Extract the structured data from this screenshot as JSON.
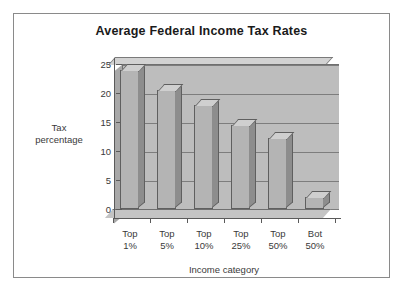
{
  "chart_data": {
    "type": "bar",
    "title": "Average Federal Income Tax Rates",
    "xlabel": "Income category",
    "ylabel": "Tax percentage",
    "ylabel_lines": [
      "Tax",
      "percentage"
    ],
    "categories": [
      "Top 1%",
      "Top 5%",
      "Top 10%",
      "Top 25%",
      "Top 50%",
      "Bot 50%"
    ],
    "category_lines": [
      [
        "Top",
        "1%"
      ],
      [
        "Top",
        "5%"
      ],
      [
        "Top",
        "10%"
      ],
      [
        "Top",
        "25%"
      ],
      [
        "Top",
        "50%"
      ],
      [
        "Bot",
        "50%"
      ]
    ],
    "values": [
      24,
      20.5,
      18,
      14.5,
      12.3,
      2
    ],
    "ylim": [
      0,
      25
    ],
    "yticks": [
      0,
      5,
      10,
      15,
      20,
      25
    ],
    "ytick_labels": [
      "0",
      "5",
      "10",
      "15",
      "20",
      "25"
    ],
    "grid": true,
    "legend": false,
    "style": "3d-bar",
    "colors": {
      "bar_front": "#b4b4b4",
      "bar_side": "#8d8d8d",
      "bar_top": "#cfcfcf",
      "plot_background": "#bdbdbd",
      "floor": "#c4c4c4",
      "axis": "#5a5a5a",
      "gridline": "#7d7d7d",
      "frame_border": "#8a8a8a",
      "page_background": "#ffffff",
      "title_text": "#1a1a1a",
      "label_text": "#3a3a3a"
    }
  }
}
